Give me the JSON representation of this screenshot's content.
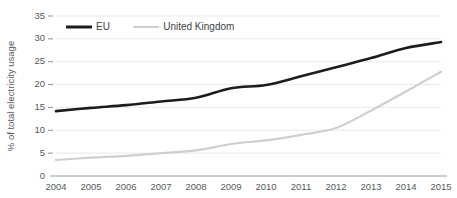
{
  "chart_data": {
    "type": "line",
    "title": "",
    "subtitle": "",
    "xlabel": "",
    "ylabel": "% of total electricity usage",
    "x": [
      2004,
      2005,
      2006,
      2007,
      2008,
      2009,
      2010,
      2011,
      2012,
      2013,
      2014,
      2015
    ],
    "categories": [
      "2004",
      "2005",
      "2006",
      "2007",
      "2008",
      "2009",
      "2010",
      "2011",
      "2012",
      "2013",
      "2014",
      "2015"
    ],
    "series": [
      {
        "name": "EU",
        "color": "#1c1c1c",
        "values": [
          14.2,
          14.9,
          15.5,
          16.3,
          17.1,
          19.2,
          19.9,
          21.8,
          23.8,
          25.8,
          28.0,
          29.3
        ]
      },
      {
        "name": "United Kingdom",
        "color": "#cfcfcf",
        "values": [
          3.5,
          4.0,
          4.4,
          5.0,
          5.6,
          7.0,
          7.8,
          9.0,
          10.5,
          14.3,
          18.5,
          22.8
        ]
      }
    ],
    "ylim": [
      0,
      35
    ],
    "yticks": [
      0,
      5,
      10,
      15,
      20,
      25,
      30,
      35
    ],
    "ytick_labels": [
      "0",
      "5",
      "10",
      "15",
      "20",
      "25",
      "30",
      "35"
    ],
    "xlim": [
      2004,
      2015
    ],
    "grid": true,
    "grid_axis": "y",
    "legend_position": "top-left",
    "legend": [
      "EU",
      "United Kingdom"
    ],
    "annotations": []
  },
  "colors": {
    "background": "#ffffff",
    "gridline": "#e3e3e3",
    "axis": "#9a9a9a",
    "text": "#55595c",
    "eu_series": "#1c1c1c",
    "uk_series": "#cfcfcf"
  }
}
